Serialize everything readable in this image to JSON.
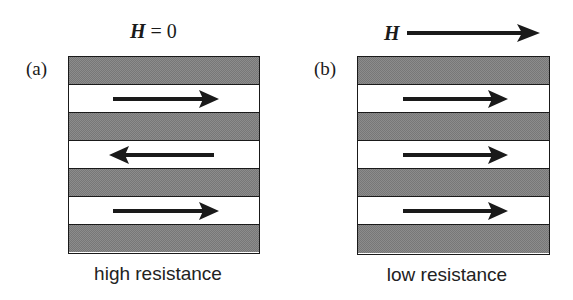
{
  "figure": {
    "panels": [
      {
        "id": "a",
        "label": "(a)",
        "field_symbol": "H",
        "field_text": " = 0",
        "caption": "high resistance",
        "layers": [
          {
            "type": "nonmagnetic"
          },
          {
            "type": "magnetic",
            "magnetization": "right"
          },
          {
            "type": "nonmagnetic"
          },
          {
            "type": "magnetic",
            "magnetization": "left"
          },
          {
            "type": "nonmagnetic"
          },
          {
            "type": "magnetic",
            "magnetization": "right"
          },
          {
            "type": "nonmagnetic"
          }
        ]
      },
      {
        "id": "b",
        "label": "(b)",
        "field_symbol": "H",
        "field_direction": "right",
        "caption": "low resistance",
        "layers": [
          {
            "type": "nonmagnetic"
          },
          {
            "type": "magnetic",
            "magnetization": "right"
          },
          {
            "type": "nonmagnetic"
          },
          {
            "type": "magnetic",
            "magnetization": "right"
          },
          {
            "type": "nonmagnetic"
          },
          {
            "type": "magnetic",
            "magnetization": "right"
          },
          {
            "type": "nonmagnetic"
          }
        ]
      }
    ],
    "colors": {
      "ink": "#1a1a1a",
      "nonmagnetic_fill": "#8c8c8c",
      "magnetic_fill": "#ffffff"
    }
  }
}
